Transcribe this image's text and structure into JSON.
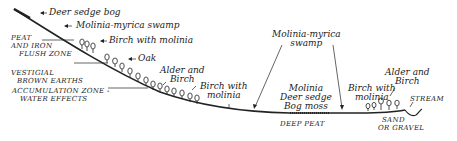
{
  "diagram": {
    "type": "slope-profile",
    "colors": {
      "ink": "#222222",
      "background": "#ffffff"
    },
    "vegetation_labels": {
      "deer_sedge_bog": "Deer sedge bog",
      "molinia_myrica_swamp_slope": "Molinia-myrica swamp",
      "birch_with_molinia_slope": "Birch with molinia",
      "oak": "Oak",
      "alder_and_birch_slope_l1": "Alder and",
      "alder_and_birch_slope_l2": "Birch",
      "birch_with_molinia_foot_l1": "Birch with",
      "birch_with_molinia_foot_l2": "molinia",
      "molinia_myrica_swamp_valley_l1": "Molinia-myrica",
      "molinia_myrica_swamp_valley_l2": "swamp",
      "valley_l1": "Molinia",
      "valley_l2": "Deer sedge",
      "valley_l3": "Bog moss",
      "birch_with_molinia_right_l1": "Birch with",
      "birch_with_molinia_right_l2": "molinia",
      "alder_and_birch_right_l1": "Alder and",
      "alder_and_birch_right_l2": "Birch",
      "stream": "STREAM"
    },
    "zone_labels": {
      "peat_iron_l1": "PEAT",
      "peat_iron_l2": "AND IRON",
      "peat_iron_l3": "FLUSH ZONE",
      "vestigial_l1": "VESTIGIAL",
      "vestigial_l2": "BROWN EARTHS",
      "accumulation_l1": "ACCUMULATION ZONE -",
      "accumulation_l2": "WATER EFFECTS",
      "deep_peat": "DEEP PEAT",
      "sand_l1": "SAND",
      "sand_l2": "OR GRAVEL"
    }
  }
}
